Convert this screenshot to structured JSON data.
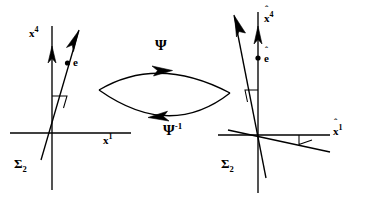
{
  "figure": {
    "stroke_color": "#000000",
    "background_color": "#ffffff"
  },
  "left_frame": {
    "name": "left-coordinate-frame",
    "frame_label": "Σ",
    "frame_label_sub": "2",
    "vertical_axis_label": "x",
    "vertical_axis_sup": "4",
    "horizontal_axis_label": "x",
    "horizontal_axis_sup": "1",
    "event_label": "e",
    "origin": {
      "x": 52,
      "y": 133
    },
    "worldline_angle_deg": 17
  },
  "right_frame": {
    "name": "right-coordinate-frame",
    "frame_label": "Σ",
    "frame_label_sub": "2",
    "vertical_axis_label": "x",
    "vertical_axis_hat": "ˆ",
    "vertical_axis_sup": "4",
    "horizontal_axis_label": "x",
    "horizontal_axis_hat": "ˆ",
    "horizontal_axis_sup": "1",
    "event_label": "e",
    "event_hat": "ˆ",
    "origin": {
      "x": 258,
      "y": 135
    },
    "worldline_angle_deg": 14
  },
  "maps": {
    "forward_label": "Ψ",
    "inverse_label": "Ψ",
    "inverse_sup": "-1"
  }
}
